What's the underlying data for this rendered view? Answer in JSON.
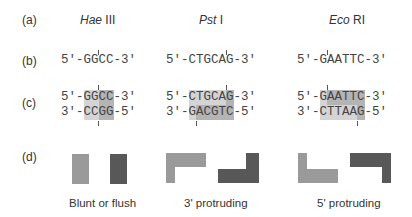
{
  "row_labels": [
    "(a)",
    "(b)",
    "(c)",
    "(d)"
  ],
  "enzymes": [
    {
      "genus": "Hae",
      "suffix": " III"
    },
    {
      "genus": "Pst",
      "suffix": " I"
    },
    {
      "genus": "Eco",
      "suffix": " RI"
    }
  ],
  "row_b": [
    {
      "prefix": "5'-",
      "site": "GGCC",
      "suffix": "-3'",
      "cut_after": 2
    },
    {
      "prefix": "5'-",
      "site": "CTGCAG",
      "suffix": "-3'",
      "cut_after": 5
    },
    {
      "prefix": "5'-",
      "site": "GAATTC",
      "suffix": "-3'",
      "cut_after": 1
    }
  ],
  "row_c": [
    {
      "top": {
        "prefix": "5'-",
        "site": "GGCC",
        "suffix": "-3'"
      },
      "bottom": {
        "prefix": "3'-",
        "site": "CCGG",
        "suffix": "-5'"
      },
      "top_cut_after": 2,
      "bottom_cut_after": 2
    },
    {
      "top": {
        "prefix": "5'-",
        "site": "CTGCAG",
        "suffix": "-3'"
      },
      "bottom": {
        "prefix": "3'-",
        "site": "GACGTC",
        "suffix": "-5'"
      },
      "top_cut_after": 5,
      "bottom_cut_after": 1
    },
    {
      "top": {
        "prefix": "5'-",
        "site": "GAATTC",
        "suffix": "-3'"
      },
      "bottom": {
        "prefix": "3'-",
        "site": "CTTAAG",
        "suffix": "-5'"
      },
      "top_cut_after": 1,
      "bottom_cut_after": 5
    }
  ],
  "row_d_captions": [
    "Blunt or flush",
    "3' protruding",
    "5' protruding"
  ],
  "colors": {
    "light_fragment": "#9a9a9a",
    "dark_fragment": "#585858",
    "light_shade": "#d4d4d4",
    "dark_shade": "#b4b4b4"
  }
}
